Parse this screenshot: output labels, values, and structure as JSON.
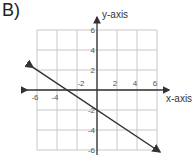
{
  "label": "B)",
  "chart_data": {
    "type": "line",
    "title": "",
    "xlabel": "x-axis",
    "ylabel": "y-axis",
    "xlim": [
      -6,
      6
    ],
    "ylim": [
      -6,
      6
    ],
    "grid": true,
    "x_ticks": [
      -6,
      -4,
      -2,
      2,
      4,
      6
    ],
    "y_ticks": [
      -6,
      -4,
      -2,
      2,
      4,
      6
    ],
    "series": [
      {
        "name": "line",
        "equation": "y = -2/3 x - 2",
        "arrows": "both",
        "x": [
          -6,
          -3,
          0,
          6
        ],
        "y": [
          2,
          0,
          -2,
          -6
        ]
      }
    ]
  }
}
